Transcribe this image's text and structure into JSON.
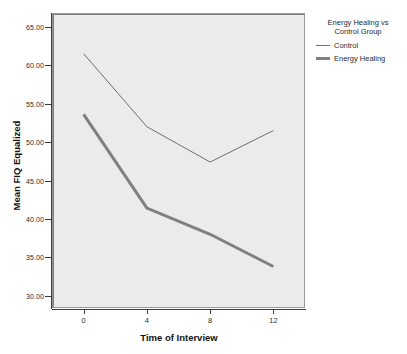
{
  "chart_data": {
    "type": "line",
    "title": "",
    "xlabel": "Time of Interview",
    "ylabel": "Mean FIQ Equalized",
    "x": [
      0,
      4,
      8,
      12
    ],
    "xticklabels": [
      "0",
      "4",
      "8",
      "12"
    ],
    "xlim": [
      -2,
      14
    ],
    "ylim": [
      28.4,
      66.8
    ],
    "yticks": [
      30,
      35,
      40,
      45,
      50,
      55,
      60,
      65
    ],
    "yticklabels": [
      "30.00",
      "35.00",
      "40.00",
      "45.00",
      "50.00",
      "55.00",
      "60.00",
      "65.00"
    ],
    "grid": false,
    "legend_position": "right",
    "legend_title": "Energy Healing vs Control Group",
    "series": [
      {
        "name": "Control",
        "values": [
          61.5,
          52.0,
          47.4,
          51.5
        ],
        "color": "#6e6e6e",
        "linewidth": 1
      },
      {
        "name": "Energy Healing",
        "values": [
          53.6,
          41.4,
          38.0,
          33.8
        ],
        "color": "#808080",
        "linewidth": 3
      }
    ],
    "plot_background": "#ebebeb",
    "page_background": "#ffffff"
  },
  "legend": {
    "title_line1": "Energy Healing vs",
    "title_line2": "Control Group",
    "entries": [
      {
        "label": "Control"
      },
      {
        "label": "Energy Healing"
      }
    ]
  },
  "axes": {
    "y_title": "Mean FIQ Equalized",
    "x_title": "Time of Interview",
    "y_labels": [
      "65.00",
      "60.00",
      "55.00",
      "50.00",
      "45.00",
      "40.00",
      "35.00",
      "30.00"
    ],
    "x_labels": [
      "0",
      "4",
      "8",
      "12"
    ]
  }
}
